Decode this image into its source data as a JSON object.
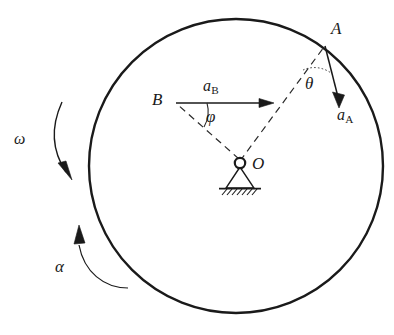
{
  "figure": {
    "colors": {
      "stroke": "#1a1a1a",
      "background": "#ffffff"
    },
    "circle": {
      "center_x": 236,
      "center_y": 166,
      "radius": 147
    },
    "points": {
      "O": {
        "x": 240,
        "y": 163,
        "label": "O"
      },
      "A": {
        "x": 325,
        "y": 45,
        "label": "A"
      },
      "B": {
        "x": 176,
        "y": 103,
        "label": "B"
      }
    },
    "vectors": [
      {
        "name": "acceleration-of-A",
        "label": "a",
        "subscript": "A",
        "from_x": 325,
        "from_y": 45,
        "to_x": 341,
        "to_y": 106
      },
      {
        "name": "acceleration-of-B",
        "label": "a",
        "subscript": "B",
        "from_x": 176,
        "from_y": 103,
        "to_x": 272,
        "to_y": 103
      }
    ],
    "angles": [
      {
        "name": "theta",
        "label": "θ",
        "at_point": "A",
        "between": "OA-line and a_A"
      },
      {
        "name": "phi",
        "label": "φ",
        "at_point": "B",
        "between": "OB-line and a_B"
      }
    ],
    "rotation_labels": [
      {
        "name": "angular-velocity",
        "label": "ω",
        "direction": "clockwise-arrow-down"
      },
      {
        "name": "angular-acceleration",
        "label": "α",
        "direction": "counterclockwise-arrow-up"
      }
    ],
    "support": {
      "name": "pin-support-with-ground-hatching",
      "ground_y": 188,
      "hatch_count": 7
    }
  }
}
